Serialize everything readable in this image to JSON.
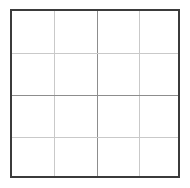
{
  "figure": {
    "name": "four-by-four-grid",
    "title": "",
    "background_color": "#ffffff",
    "border_color": "#3b3b3b",
    "border_width_px": 2,
    "gridline_color": "#c9c9c9",
    "gridline_strong_color": "#8d8d8d",
    "gridline_width_px": 1,
    "rows": 4,
    "columns": 4,
    "cell_count": 16,
    "bounds": {
      "left": 10,
      "top": 9,
      "width": 170,
      "height": 169
    }
  },
  "gridlines": {
    "vertical": [
      {
        "name": "vertical-gridline-1",
        "x_px": 42,
        "emphasis": "light"
      },
      {
        "name": "vertical-gridline-2",
        "x_px": 85,
        "emphasis": "strong"
      },
      {
        "name": "vertical-gridline-3",
        "x_px": 127,
        "emphasis": "light"
      }
    ],
    "horizontal": [
      {
        "name": "horizontal-gridline-1",
        "y_px": 42,
        "emphasis": "light"
      },
      {
        "name": "horizontal-gridline-2",
        "y_px": 84,
        "emphasis": "strong"
      },
      {
        "name": "horizontal-gridline-3",
        "y_px": 126,
        "emphasis": "light"
      }
    ]
  },
  "cells": [
    {
      "name": "cell-r1c1",
      "row": 1,
      "col": 1,
      "label": ""
    },
    {
      "name": "cell-r1c2",
      "row": 1,
      "col": 2,
      "label": ""
    },
    {
      "name": "cell-r1c3",
      "row": 1,
      "col": 3,
      "label": ""
    },
    {
      "name": "cell-r1c4",
      "row": 1,
      "col": 4,
      "label": ""
    },
    {
      "name": "cell-r2c1",
      "row": 2,
      "col": 1,
      "label": ""
    },
    {
      "name": "cell-r2c2",
      "row": 2,
      "col": 2,
      "label": ""
    },
    {
      "name": "cell-r2c3",
      "row": 2,
      "col": 3,
      "label": ""
    },
    {
      "name": "cell-r2c4",
      "row": 2,
      "col": 4,
      "label": ""
    },
    {
      "name": "cell-r3c1",
      "row": 3,
      "col": 1,
      "label": ""
    },
    {
      "name": "cell-r3c2",
      "row": 3,
      "col": 2,
      "label": ""
    },
    {
      "name": "cell-r3c3",
      "row": 3,
      "col": 3,
      "label": ""
    },
    {
      "name": "cell-r3c4",
      "row": 3,
      "col": 4,
      "label": ""
    },
    {
      "name": "cell-r4c1",
      "row": 4,
      "col": 1,
      "label": ""
    },
    {
      "name": "cell-r4c2",
      "row": 4,
      "col": 2,
      "label": ""
    },
    {
      "name": "cell-r4c3",
      "row": 4,
      "col": 3,
      "label": ""
    },
    {
      "name": "cell-r4c4",
      "row": 4,
      "col": 4,
      "label": ""
    }
  ]
}
